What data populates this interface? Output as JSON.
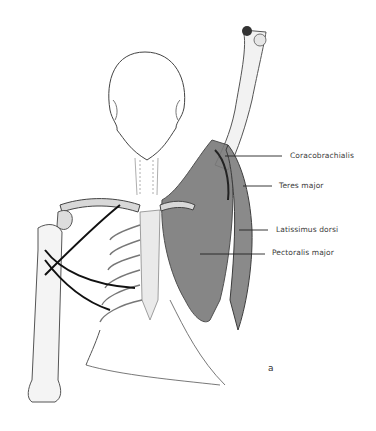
{
  "figure": {
    "panel_letter": "a",
    "labels": [
      {
        "id": "coracobrachialis",
        "text": "Coracobrachialis",
        "x": 290,
        "y": 153,
        "line_from": [
          225,
          156
        ],
        "line_to": [
          282,
          156
        ]
      },
      {
        "id": "teres-major",
        "text": "Teres major",
        "x": 279,
        "y": 183,
        "line_from": [
          243,
          186
        ],
        "line_to": [
          272,
          186
        ]
      },
      {
        "id": "latissimus-dorsi",
        "text": "Latissimus dorsi",
        "x": 276,
        "y": 227,
        "line_from": [
          239,
          230
        ],
        "line_to": [
          268,
          230
        ]
      },
      {
        "id": "pectoralis-major",
        "text": "Pectoralis major",
        "x": 272,
        "y": 250,
        "line_from": [
          200,
          254
        ],
        "line_to": [
          265,
          254
        ]
      }
    ],
    "colors": {
      "background": "#ffffff",
      "muscle": "#7a7a7a",
      "muscle_dark": "#3c3c3c",
      "bone_outline": "#555555",
      "nerve": "#111111",
      "label_text": "#3a3a3a"
    }
  }
}
